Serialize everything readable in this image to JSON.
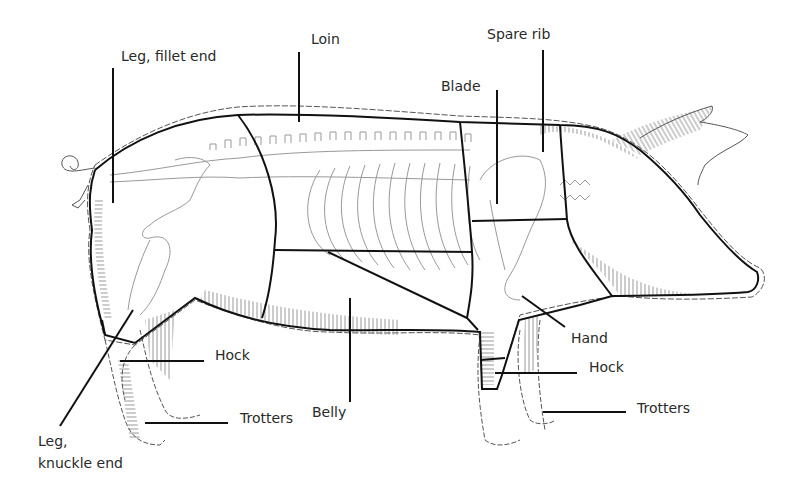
{
  "diagram": {
    "colors": {
      "line": "#111111",
      "outline": "#555555",
      "skeleton": "#888888",
      "hatch": "#777777",
      "background": "#ffffff"
    },
    "labels": [
      {
        "id": "leg-fillet-end",
        "text": "Leg, fillet end"
      },
      {
        "id": "loin",
        "text": "Loin"
      },
      {
        "id": "spare-rib",
        "text": "Spare rib"
      },
      {
        "id": "blade",
        "text": "Blade"
      },
      {
        "id": "hand",
        "text": "Hand"
      },
      {
        "id": "hock-rear",
        "text": "Hock"
      },
      {
        "id": "hock-front",
        "text": "Hock"
      },
      {
        "id": "belly",
        "text": "Belly"
      },
      {
        "id": "trotters-rear",
        "text": "Trotters"
      },
      {
        "id": "trotters-front",
        "text": "Trotters"
      },
      {
        "id": "leg-knuckle-line1",
        "text": "Leg,"
      },
      {
        "id": "leg-knuckle-line2",
        "text": "knuckle end"
      }
    ]
  }
}
